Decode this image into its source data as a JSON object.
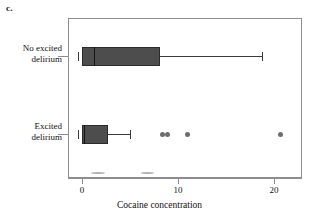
{
  "panel": {
    "letter": "c."
  },
  "chart_data": {
    "type": "box",
    "title": "",
    "xlabel": "Cocaine concentration",
    "ylabel": "",
    "orientation": "horizontal",
    "xlim": [
      -1.45,
      22.8
    ],
    "xticks": [
      0,
      10,
      20
    ],
    "xtick_labels": [
      "0",
      "10",
      "20"
    ],
    "grid": false,
    "legend": null,
    "categories": [
      "No excited delirium",
      "Excited delirium"
    ],
    "boxes": [
      {
        "category": "No excited delirium",
        "category_line1": "No excited",
        "category_line2": "delirium",
        "whisker_low": 0.0,
        "q1": 0.0,
        "median": 1.2,
        "q3": 8.1,
        "whisker_high": 18.7,
        "outliers": []
      },
      {
        "category": "Excited delirium",
        "category_line1": "Excited",
        "category_line2": "delirium",
        "whisker_low": 0.0,
        "q1": 0.0,
        "median": 0.2,
        "q3": 2.7,
        "whisker_high": 5.0,
        "outliers": [
          8.4,
          8.9,
          11.0,
          20.7
        ]
      }
    ]
  },
  "axis": {
    "tick_0": "0",
    "tick_1": "10",
    "tick_2": "20",
    "title": "Cocaine concentration"
  }
}
